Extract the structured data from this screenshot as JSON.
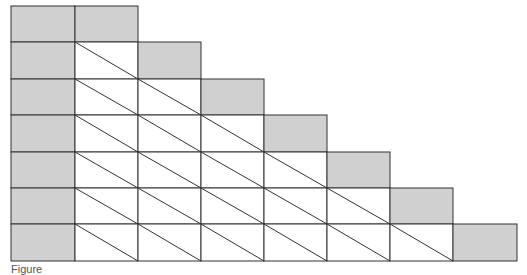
{
  "diagram": {
    "rows": 7,
    "columns": 8,
    "col_edges": [
      11,
      75,
      138,
      201,
      264,
      327,
      390,
      453,
      517
    ],
    "row_edges": [
      6,
      42,
      79,
      115,
      152,
      188,
      224,
      261
    ],
    "colors": {
      "shaded": "#d0d0d0",
      "white": "#ffffff",
      "line": "#333333"
    },
    "row_structure": [
      [
        "shaded",
        "shaded"
      ],
      [
        "shaded",
        "diagonal",
        "shaded"
      ],
      [
        "shaded",
        "diagonal",
        "diagonal",
        "shaded"
      ],
      [
        "shaded",
        "diagonal",
        "diagonal",
        "diagonal",
        "shaded"
      ],
      [
        "shaded",
        "diagonal",
        "diagonal",
        "diagonal",
        "diagonal",
        "shaded"
      ],
      [
        "shaded",
        "diagonal",
        "diagonal",
        "diagonal",
        "diagonal",
        "diagonal",
        "shaded"
      ],
      [
        "shaded",
        "diagonal",
        "diagonal",
        "diagonal",
        "diagonal",
        "diagonal",
        "diagonal",
        "shaded"
      ]
    ]
  },
  "caption": {
    "text": "Figure"
  }
}
